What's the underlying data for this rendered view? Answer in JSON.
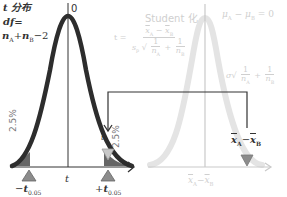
{
  "left_panel": {
    "title": "t 分布",
    "df_label": "df=",
    "df_formula": "nA + nB − 2",
    "df_parts": {
      "n": "n",
      "A": "A",
      "plus": "+",
      "B": "B",
      "minus2": "−2"
    },
    "peak_label": "0",
    "x_axis_label": "t",
    "left_tail_percent": "2.5%",
    "right_tail_percent": "2.5%",
    "left_critical": {
      "sign": "−",
      "t": "t",
      "sub": "0.05"
    },
    "right_critical": {
      "sign": "+",
      "t": "t",
      "sub": "0.05"
    },
    "t_marker": "t"
  },
  "middle": {
    "heading": "Student 化",
    "t_eq": "t =",
    "numerator": {
      "a": "x",
      "a_sub": "A",
      "minus": "−",
      "b": "x",
      "b_sub": "B"
    },
    "denominator": {
      "s": "s",
      "s_sub": "p",
      "one": "1",
      "nA": "n",
      "nA_sub": "A",
      "plus": "+",
      "nB": "n",
      "nB_sub": "B"
    }
  },
  "right_panel": {
    "hypothesis": {
      "mu": "μ",
      "a_sub": "A",
      "minus": "−",
      "b_sub": "B",
      "eq": "= 0"
    },
    "sigma_term": {
      "sigma": "σ",
      "one": "1",
      "n": "n",
      "a_sub": "A",
      "plus": "+",
      "b_sub": "B"
    },
    "observed_label": {
      "x": "x",
      "a_sub": "A",
      "minus": "−",
      "b_sub": "B"
    },
    "x_axis_label": {
      "x": "x",
      "a_sub": "A",
      "minus": "−",
      "b_sub": "B"
    }
  },
  "colors": {
    "curve_dark": "#2d2d2d",
    "curve_faint": "#e6e6e6",
    "axis_dark": "#333333",
    "axis_faint": "#c9c9c9",
    "marker_gray": "#8c8c8c",
    "tail_fill": "#555555",
    "text_faint": "#cfcfcf"
  }
}
